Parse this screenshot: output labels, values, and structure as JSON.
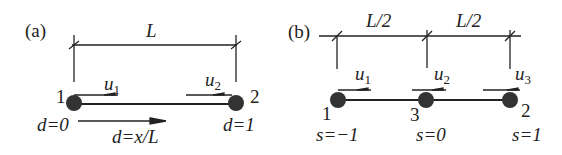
{
  "panel_a": {
    "label": "(a)",
    "length_label": "L",
    "node_left": "1",
    "node_right": "2",
    "dof_left": {
      "base": "u",
      "sub": "1"
    },
    "dof_right": {
      "base": "u",
      "sub": "2"
    },
    "coord_left": "d=0",
    "coord_right": "d=1",
    "coord_formula": "d=x/L"
  },
  "panel_b": {
    "label": "(b)",
    "length_left": "L/2",
    "length_right": "L/2",
    "node_left": "1",
    "node_mid": "3",
    "node_right": "2",
    "dof_1": {
      "base": "u",
      "sub": "1"
    },
    "dof_2": {
      "base": "u",
      "sub": "2"
    },
    "dof_3": {
      "base": "u",
      "sub": "3"
    },
    "coord_left": "s=−1",
    "coord_mid": "s=0",
    "coord_right": "s=1"
  },
  "colors": {
    "ink": "#222222",
    "node": "#333333"
  }
}
